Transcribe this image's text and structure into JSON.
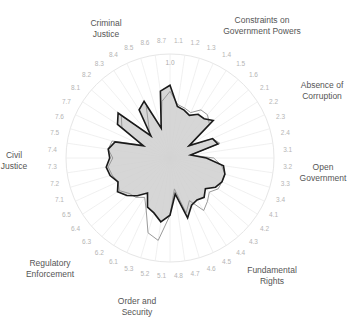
{
  "chart_data": {
    "type": "radar",
    "title": "",
    "center": [
      170,
      158
    ],
    "radius": 104,
    "range": [
      0,
      1
    ],
    "ring_label": "1.0",
    "grid": true,
    "spokes": [
      "1.1",
      "1.2",
      "1.3",
      "1.4",
      "1.5",
      "1.6",
      "2.1",
      "2.2",
      "2.3",
      "2.4",
      "3.1",
      "3.2",
      "3.3",
      "3.4",
      "4.1",
      "4.2",
      "4.3",
      "4.4",
      "4.5",
      "4.6",
      "4.7",
      "4.8",
      "5.1",
      "5.2",
      "5.3",
      "6.1",
      "6.2",
      "6.3",
      "6.4",
      "6.5",
      "7.1",
      "7.2",
      "7.3",
      "7.4",
      "7.5",
      "7.6",
      "7.7",
      "8.1",
      "8.2",
      "8.3",
      "8.4",
      "8.5",
      "8.6",
      "8.7"
    ],
    "dimensions": [
      {
        "label": [
          "Constraints on",
          "Government Powers"
        ],
        "x": 262,
        "y": 23,
        "anchor": "middle"
      },
      {
        "label": [
          "Absence of",
          "Corruption"
        ],
        "x": 322,
        "y": 88,
        "anchor": "middle"
      },
      {
        "label": [
          "Open",
          "Government"
        ],
        "x": 323,
        "y": 170,
        "anchor": "middle"
      },
      {
        "label": [
          "Fundamental",
          "Rights"
        ],
        "x": 272,
        "y": 273,
        "anchor": "middle"
      },
      {
        "label": [
          "Order and",
          "Security"
        ],
        "x": 137,
        "y": 304,
        "anchor": "middle"
      },
      {
        "label": [
          "Regulatory",
          "Enforcement"
        ],
        "x": 50,
        "y": 266,
        "anchor": "middle"
      },
      {
        "label": [
          "Civil",
          "Justice"
        ],
        "x": 14,
        "y": 158,
        "anchor": "middle"
      },
      {
        "label": [
          "Criminal",
          "Justice"
        ],
        "x": 106,
        "y": 26,
        "anchor": "middle"
      }
    ],
    "series": [
      {
        "name": "comparison",
        "color": "#9a9a9a",
        "fill": "none",
        "values": [
          0.64,
          0.52,
          0.5,
          0.48,
          0.55,
          0.55,
          0.5,
          0.2,
          0.45,
          0.5,
          0.2,
          0.42,
          0.5,
          0.55,
          0.55,
          0.55,
          0.5,
          0.55,
          0.6,
          0.45,
          0.55,
          0.3,
          0.55,
          0.8,
          0.75,
          0.55,
          0.45,
          0.5,
          0.52,
          0.58,
          0.55,
          0.58,
          0.6,
          0.55,
          0.6,
          0.58,
          0.3,
          0.55,
          0.62,
          0.3,
          0.38,
          0.55,
          0.3,
          0.55
        ]
      },
      {
        "name": "country",
        "color": "#1a1a1a",
        "fill": "#cfcfcf",
        "values": [
          0.7,
          0.5,
          0.48,
          0.45,
          0.5,
          0.5,
          0.55,
          0.22,
          0.45,
          0.48,
          0.2,
          0.35,
          0.52,
          0.55,
          0.55,
          0.52,
          0.45,
          0.5,
          0.48,
          0.5,
          0.6,
          0.35,
          0.55,
          0.62,
          0.55,
          0.52,
          0.4,
          0.48,
          0.55,
          0.6,
          0.55,
          0.6,
          0.62,
          0.58,
          0.6,
          0.55,
          0.28,
          0.6,
          0.66,
          0.28,
          0.55,
          0.6,
          0.3,
          0.65
        ]
      }
    ]
  }
}
